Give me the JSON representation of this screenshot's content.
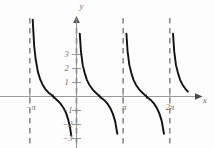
{
  "figure": {
    "kind": "math-function-plot",
    "axis_labels": {
      "x": "x",
      "y": "y"
    },
    "axis_color": "#9a9a9a",
    "curve_color": "#111111",
    "asymptote_color": "#8c8c8c",
    "label_color": "#6f6f6f",
    "background": "#fdfdfd"
  },
  "chart_data": {
    "type": "line",
    "title": "",
    "subtitle": "",
    "xlabel": "x",
    "ylabel": "y",
    "grid": false,
    "legend": null,
    "function": "y = cot(x)",
    "xlim": [
      -4.2,
      7.6
    ],
    "ylim": [
      -3.6,
      4.0
    ],
    "x_ticks": [
      {
        "value": -3.14159,
        "label": "−π"
      },
      {
        "value": 3.14159,
        "label": "π"
      },
      {
        "value": 6.28319,
        "label": "2π"
      }
    ],
    "y_ticks": [
      {
        "value": 3,
        "label": "3"
      },
      {
        "value": 2,
        "label": "2"
      },
      {
        "value": 1,
        "label": "1"
      },
      {
        "value": -1,
        "label": "−1"
      },
      {
        "value": -2,
        "label": "−2"
      },
      {
        "value": -3,
        "label": "−3"
      }
    ],
    "asymptotes": [
      {
        "type": "vertical",
        "x": -3.14159,
        "label": "x = −π"
      },
      {
        "type": "vertical",
        "x": 0,
        "label": "x = 0"
      },
      {
        "type": "vertical",
        "x": 3.14159,
        "label": "x = π"
      },
      {
        "type": "vertical",
        "x": 6.28319,
        "label": "x = 2π"
      }
    ],
    "series": [
      {
        "name": "cot(x) branch 1",
        "x": [
          -3.05,
          -2.95,
          -2.85,
          -2.75,
          -2.6,
          -2.45,
          -2.3,
          -2.1,
          -1.9,
          -1.7,
          -1.5708,
          -1.45,
          -1.25,
          -1.05,
          -0.85,
          -0.7,
          -0.55,
          -0.45,
          -0.35,
          -0.25,
          -0.18,
          -0.12
        ],
        "y": [
          10.98,
          5.49,
          3.61,
          2.66,
          1.76,
          1.24,
          0.88,
          0.53,
          0.29,
          0.13,
          0.0,
          -0.12,
          -0.32,
          -0.55,
          -0.86,
          -1.19,
          -1.69,
          -2.12,
          -2.79,
          -3.92,
          -5.49,
          -8.29
        ]
      },
      {
        "name": "cot(x) branch 2",
        "x": [
          0.1,
          0.15,
          0.22,
          0.3,
          0.42,
          0.55,
          0.7,
          0.85,
          1.05,
          1.25,
          1.45,
          1.5708,
          1.7,
          1.9,
          2.1,
          2.3,
          2.45,
          2.6,
          2.75,
          2.85,
          2.95,
          3.04
        ],
        "y": [
          9.97,
          6.62,
          4.49,
          3.23,
          2.24,
          1.69,
          1.19,
          0.86,
          0.55,
          0.32,
          0.12,
          0.0,
          -0.13,
          -0.29,
          -0.53,
          -0.88,
          -1.24,
          -1.76,
          -2.66,
          -3.61,
          -5.49,
          -9.87
        ]
      },
      {
        "name": "cot(x) branch 3",
        "x": [
          3.24,
          3.29,
          3.36,
          3.44,
          3.56,
          3.69,
          3.84,
          3.99,
          4.19,
          4.39,
          4.59,
          4.7124,
          4.84,
          5.04,
          5.24,
          5.44,
          5.59,
          5.74,
          5.89,
          5.99,
          6.09,
          6.18
        ],
        "y": [
          9.97,
          6.62,
          4.49,
          3.23,
          2.24,
          1.69,
          1.19,
          0.86,
          0.55,
          0.32,
          0.12,
          0.0,
          -0.13,
          -0.29,
          -0.53,
          -0.88,
          -1.24,
          -1.76,
          -2.66,
          -3.61,
          -5.49,
          -9.87
        ]
      },
      {
        "name": "cot(x) branch 4",
        "x": [
          6.38,
          6.43,
          6.5,
          6.58,
          6.7,
          6.83,
          6.98,
          7.13,
          7.33,
          7.5
        ],
        "y": [
          9.97,
          6.62,
          4.49,
          3.23,
          2.24,
          1.69,
          1.19,
          0.86,
          0.55,
          0.35
        ]
      }
    ]
  },
  "axes": {
    "x_axis_name": "x",
    "y_axis_name": "y"
  }
}
